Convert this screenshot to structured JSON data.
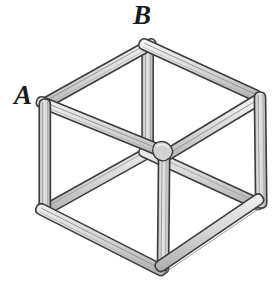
{
  "figure": {
    "name": "wireframe-cube",
    "type": "isometric-skeletal-cube",
    "background_color": "#ffffff",
    "beam_fill_color": "#d9d9d9",
    "beam_highlight_color": "#f2f2f2",
    "beam_shadow_color": "#b4b4b4",
    "beam_outline_color": "#3c3c3c",
    "beam_thickness_px": 11,
    "labels": [
      {
        "id": "A",
        "text": "A",
        "vertex": "left-top-corner",
        "x": 25,
        "y": 98
      },
      {
        "id": "B",
        "text": "B",
        "vertex": "back-top-corner",
        "x": 145,
        "y": 18
      }
    ],
    "vertices": {
      "top_back": {
        "x": 148,
        "y": 45
      },
      "top_left": {
        "x": 45,
        "y": 103
      },
      "top_right": {
        "x": 259,
        "y": 96
      },
      "top_front": {
        "x": 165,
        "y": 152
      },
      "bottom_back": {
        "x": 148,
        "y": 152
      },
      "bottom_left": {
        "x": 45,
        "y": 210
      },
      "bottom_right": {
        "x": 261,
        "y": 204
      },
      "bottom_front": {
        "x": 163,
        "y": 270
      }
    },
    "edges": [
      "top_back-top_left",
      "top_back-top_right",
      "top_left-top_front",
      "top_right-top_front",
      "bottom_left-bottom_front",
      "bottom_right-bottom_front",
      "top_left-bottom_left",
      "top_right-bottom_right",
      "top_front-bottom_front",
      "top_back-bottom_back",
      "bottom_back-bottom_left",
      "bottom_back-bottom_right"
    ]
  }
}
